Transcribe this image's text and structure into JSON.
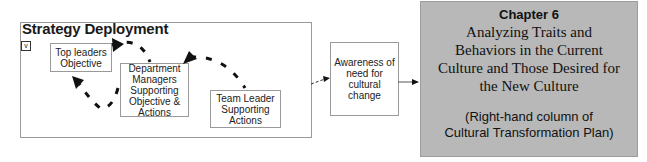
{
  "strategy_deployment": {
    "title": "Strategy Deployment",
    "toggle_glyph": "v",
    "boxes": {
      "top_leaders": [
        "Top leaders",
        "Objective"
      ],
      "department_managers": [
        "Department",
        "Managers",
        "Supporting",
        "Objective &",
        "Actions"
      ],
      "team_leader": [
        "Team Leader",
        "Supporting",
        "Actions"
      ]
    }
  },
  "awareness": {
    "lines": [
      "Awareness of",
      "need for",
      "cultural change"
    ]
  },
  "chapter": {
    "title": "Chapter 6",
    "subtitle_lines": [
      "Analyzing Traits and",
      "Behaviors in the Current",
      "Culture and Those Desired for",
      "the New Culture"
    ],
    "note_lines": [
      "(Right-hand column of",
      "Cultural Transformation Plan)"
    ],
    "background_color": "#b8b8b8"
  },
  "icons": {
    "cycle_arrows": "dashed-curved-arrow",
    "flow_arrow": "right-arrow"
  }
}
